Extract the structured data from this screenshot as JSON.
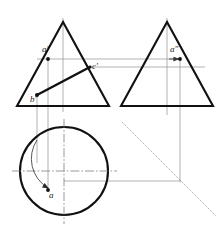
{
  "drawing": {
    "title": "Orthographic three-view projection of a cone with point A on its surface",
    "colors": {
      "outline": "#111111",
      "projection": "#8a8a8a",
      "center": "#6f6f6f",
      "miter": "#7a7a7a",
      "point": "#111111",
      "background": "#ffffff"
    },
    "views": {
      "front": {
        "name": "front-view-cone",
        "apex": {
          "x": 63,
          "y": 22
        },
        "base_left": {
          "x": 17,
          "y": 106
        },
        "base_right": {
          "x": 109,
          "y": 106
        },
        "axis_top": {
          "x": 63,
          "y": 18
        },
        "axis_bottom": {
          "x": 63,
          "y": 112
        }
      },
      "side": {
        "name": "side-view-cone",
        "apex": {
          "x": 167,
          "y": 22
        },
        "base_left": {
          "x": 121,
          "y": 106
        },
        "base_right": {
          "x": 213,
          "y": 106
        },
        "axis_top": {
          "x": 167,
          "y": 18
        },
        "axis_bottom": {
          "x": 167,
          "y": 112
        }
      },
      "top": {
        "name": "top-view-circle",
        "center": {
          "x": 64,
          "y": 171
        },
        "radius": 44
      }
    },
    "points": [
      {
        "id": "a-front",
        "label": "a′",
        "x": 48,
        "y": 59,
        "label_dx": -3,
        "label_dy": -11,
        "view": "front"
      },
      {
        "id": "c-front",
        "label": "c′",
        "x": 89,
        "y": 67,
        "label_dx": 3,
        "label_dy": -2,
        "view": "front"
      },
      {
        "id": "b-front",
        "label": "b′",
        "x": 37,
        "y": 95,
        "label_dx": -2,
        "label_dy": 2,
        "view": "front"
      },
      {
        "id": "a-side",
        "label": "a″",
        "x": 180,
        "y": 59,
        "label_dx": -6,
        "label_dy": -11,
        "view": "side"
      },
      {
        "id": "a-top",
        "label": "a",
        "x": 48,
        "y": 190,
        "label_dx": 2,
        "label_dy": 3,
        "view": "top"
      }
    ],
    "elements": {
      "generatrix_label": "generatrix b′c′",
      "miter_line_label": "45° miter line",
      "rotation_arrow_label": "rotation arc"
    },
    "miter": {
      "start": {
        "x": 122,
        "y": 122
      },
      "end": {
        "x": 215,
        "y": 215
      },
      "corner": {
        "x": 181,
        "y": 181
      }
    },
    "projection_lines": [
      {
        "id": "pl-a-front-down",
        "x1": 48,
        "y1": 59,
        "x2": 48,
        "y2": 190
      },
      {
        "id": "pl-b-front-down",
        "x1": 37,
        "y1": 95,
        "x2": 37,
        "y2": 162
      },
      {
        "id": "pl-a-horizontal",
        "x1": 37,
        "y1": 59,
        "x2": 180,
        "y2": 59
      },
      {
        "id": "pl-a-side-down",
        "x1": 180,
        "y1": 59,
        "x2": 180,
        "y2": 181
      },
      {
        "id": "pl-top-right-h",
        "x1": 64,
        "y1": 181,
        "x2": 181,
        "y2": 181
      },
      {
        "id": "pl-front-base-h",
        "x1": 17,
        "y1": 106,
        "x2": 121,
        "y2": 106
      },
      {
        "id": "pl-side-base-h",
        "x1": 121,
        "y1": 106,
        "x2": 213,
        "y2": 106
      }
    ],
    "center_lines": [
      {
        "id": "cl-top-horizontal",
        "x1": 12,
        "y1": 171,
        "x2": 116,
        "y2": 171
      },
      {
        "id": "cl-top-vertical",
        "x1": 64,
        "y1": 119,
        "x2": 64,
        "y2": 223
      }
    ]
  }
}
